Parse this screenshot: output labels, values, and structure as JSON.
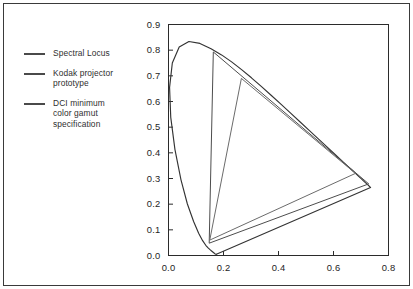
{
  "figure": {
    "title": "",
    "background_color": "#ffffff",
    "frame_color": "#3a3a3a"
  },
  "legend": {
    "position": "left",
    "items": [
      {
        "label": "Spectral Locus",
        "color": "#4a4a4a",
        "name": "spectral-locus"
      },
      {
        "label": "Kodak projector\nprototype",
        "color": "#4a4a4a",
        "name": "kodak-projector-prototype"
      },
      {
        "label": "DCI minimum\ncolor gamut\nspecification",
        "color": "#4a4a4a",
        "name": "dci-minimum-color-gamut"
      }
    ]
  },
  "axes": {
    "x": {
      "label": "",
      "min": 0.0,
      "max": 0.8,
      "ticks": [
        "0.0",
        "0.2",
        "0.4",
        "0.6",
        "0.8"
      ],
      "tick_values": [
        0.0,
        0.2,
        0.4,
        0.6,
        0.8
      ]
    },
    "y": {
      "label": "",
      "min": 0.0,
      "max": 0.9,
      "ticks": [
        "0.0",
        "0.1",
        "0.2",
        "0.3",
        "0.4",
        "0.5",
        "0.6",
        "0.7",
        "0.8",
        "0.9"
      ],
      "tick_values": [
        0.0,
        0.1,
        0.2,
        0.3,
        0.4,
        0.5,
        0.6,
        0.7,
        0.8,
        0.9
      ]
    },
    "grid": false
  },
  "chart_data": {
    "type": "line",
    "title": "",
    "xlabel": "",
    "ylabel": "",
    "xlim": [
      0.0,
      0.8
    ],
    "ylim": [
      0.0,
      0.9
    ],
    "grid": false,
    "legend_position": "left-outside",
    "series": [
      {
        "name": "Spectral Locus",
        "type": "closed-curve",
        "color": "#333333",
        "points": [
          [
            0.1741,
            0.005
          ],
          [
            0.174,
            0.005
          ],
          [
            0.1738,
            0.0049
          ],
          [
            0.1736,
            0.0049
          ],
          [
            0.1733,
            0.0048
          ],
          [
            0.173,
            0.0048
          ],
          [
            0.1726,
            0.0048
          ],
          [
            0.1721,
            0.0048
          ],
          [
            0.1714,
            0.0051
          ],
          [
            0.1703,
            0.0058
          ],
          [
            0.1689,
            0.0069
          ],
          [
            0.1669,
            0.0086
          ],
          [
            0.1644,
            0.0109
          ],
          [
            0.1611,
            0.0138
          ],
          [
            0.1566,
            0.0177
          ],
          [
            0.151,
            0.0227
          ],
          [
            0.144,
            0.0297
          ],
          [
            0.1355,
            0.0399
          ],
          [
            0.1241,
            0.0578
          ],
          [
            0.1096,
            0.0868
          ],
          [
            0.0913,
            0.1327
          ],
          [
            0.0687,
            0.2007
          ],
          [
            0.0454,
            0.295
          ],
          [
            0.0235,
            0.4127
          ],
          [
            0.0082,
            0.5384
          ],
          [
            0.0039,
            0.6548
          ],
          [
            0.0139,
            0.7502
          ],
          [
            0.0389,
            0.812
          ],
          [
            0.0743,
            0.8338
          ],
          [
            0.1142,
            0.8262
          ],
          [
            0.1547,
            0.8059
          ],
          [
            0.1929,
            0.7816
          ],
          [
            0.2296,
            0.7543
          ],
          [
            0.2658,
            0.7243
          ],
          [
            0.3016,
            0.6923
          ],
          [
            0.3373,
            0.6589
          ],
          [
            0.3731,
            0.6245
          ],
          [
            0.4087,
            0.5896
          ],
          [
            0.4441,
            0.5547
          ],
          [
            0.4788,
            0.5202
          ],
          [
            0.5125,
            0.4866
          ],
          [
            0.5448,
            0.4544
          ],
          [
            0.5752,
            0.4242
          ],
          [
            0.6029,
            0.3965
          ],
          [
            0.627,
            0.3725
          ],
          [
            0.6482,
            0.3514
          ],
          [
            0.6658,
            0.334
          ],
          [
            0.6801,
            0.3197
          ],
          [
            0.6915,
            0.3083
          ],
          [
            0.7006,
            0.2993
          ],
          [
            0.7079,
            0.292
          ],
          [
            0.714,
            0.2859
          ],
          [
            0.719,
            0.2809
          ],
          [
            0.723,
            0.277
          ],
          [
            0.726,
            0.274
          ],
          [
            0.7283,
            0.2717
          ],
          [
            0.73,
            0.27
          ],
          [
            0.7311,
            0.2689
          ],
          [
            0.732,
            0.268
          ],
          [
            0.7327,
            0.2673
          ],
          [
            0.7334,
            0.2666
          ],
          [
            0.734,
            0.266
          ],
          [
            0.7344,
            0.2656
          ],
          [
            0.7346,
            0.2654
          ],
          [
            0.7347,
            0.2653
          ]
        ],
        "closing_line": "purple-line"
      },
      {
        "name": "Kodak projector prototype",
        "type": "triangle",
        "color": "#4d4d4d",
        "vertices": [
          {
            "name": "green",
            "x": 0.163,
            "y": 0.793
          },
          {
            "name": "red",
            "x": 0.728,
            "y": 0.279
          },
          {
            "name": "blue",
            "x": 0.148,
            "y": 0.048
          }
        ]
      },
      {
        "name": "DCI minimum color gamut specification",
        "type": "triangle",
        "color": "#6b6b6b",
        "vertices": [
          {
            "name": "green",
            "x": 0.265,
            "y": 0.69
          },
          {
            "name": "red",
            "x": 0.68,
            "y": 0.32
          },
          {
            "name": "blue",
            "x": 0.15,
            "y": 0.06
          }
        ]
      }
    ]
  }
}
